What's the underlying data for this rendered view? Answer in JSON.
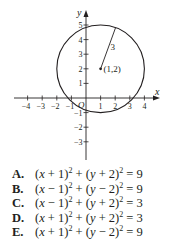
{
  "diagram": {
    "type": "coordinate-plane-circle",
    "x_axis_label": "x",
    "y_axis_label": "y",
    "origin_label": "O",
    "x_ticks": [
      -4,
      -3,
      -2,
      -1,
      1,
      2,
      3,
      4
    ],
    "y_ticks": [
      -3,
      -2,
      -1,
      1,
      2,
      3,
      4,
      5
    ],
    "x_tick_labels": [
      "−4",
      "−3",
      "−2",
      "−1",
      "1",
      "2",
      "3",
      "4"
    ],
    "y_tick_labels": [
      "−3",
      "−2",
      "−1",
      "1",
      "2",
      "3",
      "4",
      "5"
    ],
    "circle": {
      "center": [
        1,
        2
      ],
      "radius": 3
    },
    "center_label": "(1,2)",
    "radius_label": "3",
    "colors": {
      "ink": "#231f20",
      "background": "#ffffff"
    }
  },
  "choices": [
    {
      "letter": "A.",
      "h_sign": "+",
      "h": "1",
      "k_sign": "+",
      "k": "2",
      "r2": "9"
    },
    {
      "letter": "B.",
      "h_sign": "−",
      "h": "1",
      "k_sign": "−",
      "k": "2",
      "r2": "9"
    },
    {
      "letter": "C.",
      "h_sign": "−",
      "h": "1",
      "k_sign": "+",
      "k": "2",
      "r2": "3"
    },
    {
      "letter": "D.",
      "h_sign": "+",
      "h": "1",
      "k_sign": "+",
      "k": "2",
      "r2": "3"
    },
    {
      "letter": "E.",
      "h_sign": "+",
      "h": "1",
      "k_sign": "−",
      "k": "2",
      "r2": "9"
    }
  ]
}
